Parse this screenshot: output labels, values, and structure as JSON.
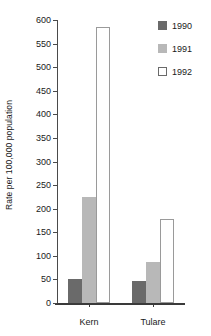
{
  "chart_data": {
    "type": "bar",
    "title": "",
    "xlabel": "",
    "ylabel": "Rate per 100,000 population",
    "categories": [
      "Kern",
      "Tulare"
    ],
    "series": [
      {
        "name": "1990",
        "values": [
          50,
          47
        ],
        "color": "#6a6a6a"
      },
      {
        "name": "1991",
        "values": [
          225,
          87
        ],
        "color": "#b8b8b8"
      },
      {
        "name": "1992",
        "values": [
          585,
          178
        ],
        "color": "#ffffff"
      }
    ],
    "ylim": [
      0,
      600
    ],
    "yticks": [
      0,
      50,
      100,
      150,
      200,
      250,
      300,
      350,
      400,
      450,
      500,
      550,
      600
    ],
    "ytick_labels": [
      "0",
      "50",
      "100",
      "150",
      "200",
      "250",
      "300",
      "350",
      "400",
      "450",
      "500",
      "550",
      "600"
    ],
    "grid": false,
    "legend_position": "top-right",
    "legend_entries": [
      "1990",
      "1991",
      "1992"
    ]
  },
  "axis": {
    "y_title": "Rate per 100,000 population"
  }
}
